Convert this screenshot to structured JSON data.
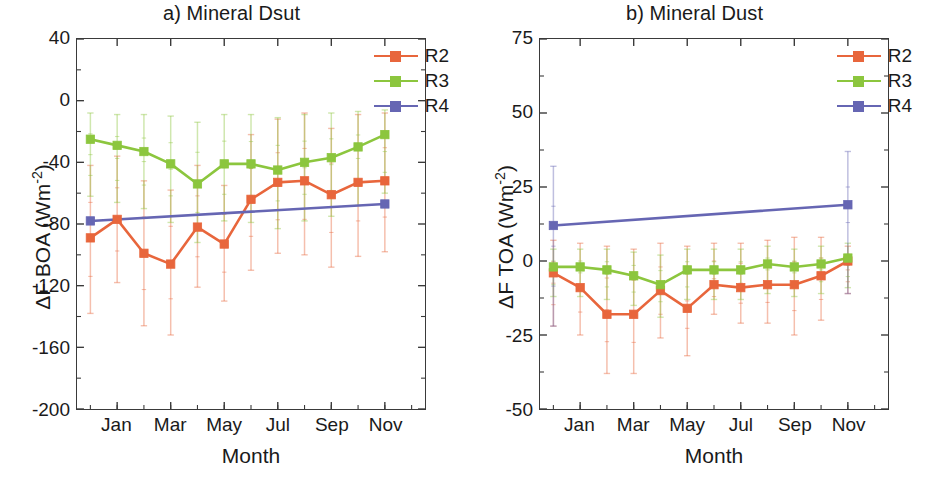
{
  "figure": {
    "axis_title_x": "Month",
    "tick_labels_x": [
      "Jan",
      "Mar",
      "May",
      "Jul",
      "Sep",
      "Nov"
    ],
    "colors": {
      "R2": "#E8663C",
      "R3": "#8CC63E",
      "R4": "#6666B3",
      "axis": "#3a3a3a",
      "text": "#1a1a1a",
      "background": "#ffffff"
    },
    "legend_entries": [
      "R2",
      "R3",
      "R4"
    ]
  },
  "panel_a": {
    "title": "a) Mineral Dsut",
    "axis_title_y_main": "ΔF BOA (Wm",
    "axis_title_y_sup": "-2",
    "axis_title_y_close": ")",
    "tick_labels_y": [
      "40",
      "0",
      "-40",
      "-80",
      "-120",
      "-160",
      "-200"
    ]
  },
  "panel_b": {
    "title": "b)  Mineral Dust",
    "axis_title_y_main": "ΔF TOA (Wm",
    "axis_title_y_sup": "-2",
    "axis_title_y_close": ")",
    "tick_labels_y": [
      "75",
      "50",
      "25",
      "0",
      "-25",
      "-50"
    ]
  },
  "chart_data": [
    {
      "type": "line",
      "panel": "a",
      "title": "a) Mineral Dsut",
      "xlabel": "Month",
      "ylabel": "ΔF BOA (Wm-2)",
      "ylim": [
        -200,
        40
      ],
      "yticks": [
        40,
        0,
        -40,
        -80,
        -120,
        -160,
        -200
      ],
      "xlim": [
        0,
        13
      ],
      "x": [
        0.5,
        1.5,
        2.5,
        3.5,
        4.5,
        5.5,
        6.5,
        7.5,
        8.5,
        9.5,
        10.5,
        11.5,
        12.5
      ],
      "xticks": [
        1.5,
        3.5,
        5.5,
        7.5,
        9.5,
        11.5
      ],
      "xticklabels": [
        "Jan",
        "Mar",
        "May",
        "Jul",
        "Sep",
        "Nov"
      ],
      "grid": false,
      "legend_position": "upper right",
      "series": [
        {
          "name": "R2",
          "color": "#E8663C",
          "marker": "square",
          "values": [
            -89,
            -77,
            -99,
            -106,
            -82,
            -93,
            -64,
            -53,
            -52,
            -61,
            -53,
            -52,
            null
          ],
          "err_low": [
            -138,
            -118,
            -146,
            -152,
            -121,
            -130,
            -110,
            -99,
            -100,
            -108,
            -101,
            -98,
            null
          ],
          "err_high": [
            -42,
            -36,
            -52,
            -58,
            -42,
            -55,
            -22,
            -12,
            -8,
            -18,
            -9,
            -8,
            null
          ]
        },
        {
          "name": "R3",
          "color": "#8CC63E",
          "marker": "square",
          "values": [
            -25,
            -29,
            -33,
            -41,
            -54,
            -41,
            -41,
            -45,
            -40,
            -37,
            -30,
            -22,
            null
          ],
          "err_low": [
            -62,
            -66,
            -70,
            -79,
            -92,
            -78,
            -79,
            -83,
            -78,
            -75,
            -68,
            -60,
            null
          ],
          "err_high": [
            -8,
            -9,
            -9,
            -10,
            -14,
            -9,
            -9,
            -11,
            -9,
            -8,
            -7,
            -6,
            null
          ]
        },
        {
          "name": "R4",
          "color": "#6666B3",
          "marker": "square",
          "values": [
            -78,
            null,
            null,
            null,
            null,
            null,
            null,
            null,
            null,
            null,
            null,
            -67,
            null
          ],
          "err_low": [
            -78,
            null,
            null,
            null,
            null,
            null,
            null,
            null,
            null,
            null,
            null,
            -67,
            null
          ],
          "err_high": [
            -78,
            null,
            null,
            null,
            null,
            null,
            null,
            null,
            null,
            null,
            null,
            -67,
            null
          ]
        }
      ]
    },
    {
      "type": "line",
      "panel": "b",
      "title": "b)  Mineral Dust",
      "xlabel": "Month",
      "ylabel": "ΔF TOA (Wm-2)",
      "ylim": [
        -50,
        75
      ],
      "yticks": [
        75,
        50,
        25,
        0,
        -25,
        -50
      ],
      "xlim": [
        0,
        13
      ],
      "x": [
        0.5,
        1.5,
        2.5,
        3.5,
        4.5,
        5.5,
        6.5,
        7.5,
        8.5,
        9.5,
        10.5,
        11.5,
        12.5
      ],
      "xticks": [
        1.5,
        3.5,
        5.5,
        7.5,
        9.5,
        11.5
      ],
      "xticklabels": [
        "Jan",
        "Mar",
        "May",
        "Jul",
        "Sep",
        "Nov"
      ],
      "grid": false,
      "legend_position": "upper right",
      "series": [
        {
          "name": "R2",
          "color": "#E8663C",
          "marker": "square",
          "values": [
            -4,
            -9,
            -18,
            -18,
            -10,
            -16,
            -8,
            -9,
            -8,
            -8,
            -5,
            0,
            null
          ],
          "err_low": [
            -22,
            -25,
            -38,
            -38,
            -26,
            -32,
            -18,
            -21,
            -21,
            -25,
            -20,
            -11,
            null
          ],
          "err_high": [
            7,
            6,
            5,
            4,
            6,
            5,
            6,
            6,
            7,
            8,
            8,
            5,
            null
          ]
        },
        {
          "name": "R3",
          "color": "#8CC63E",
          "marker": "square",
          "values": [
            -2,
            -2,
            -3,
            -5,
            -8,
            -3,
            -3,
            -3,
            -1,
            -2,
            -1,
            1,
            null
          ],
          "err_low": [
            -12,
            -12,
            -13,
            -15,
            -19,
            -13,
            -13,
            -13,
            -11,
            -12,
            -11,
            -9,
            null
          ],
          "err_high": [
            4,
            4,
            4,
            3,
            2,
            4,
            4,
            4,
            5,
            4,
            5,
            6,
            null
          ]
        },
        {
          "name": "R4",
          "color": "#6666B3",
          "marker": "square",
          "values": [
            12,
            null,
            null,
            null,
            null,
            null,
            null,
            null,
            null,
            null,
            null,
            19,
            null
          ],
          "err_low": [
            -22,
            null,
            null,
            null,
            null,
            null,
            null,
            null,
            null,
            null,
            null,
            -11,
            null
          ],
          "err_high": [
            32,
            null,
            null,
            null,
            null,
            null,
            null,
            null,
            null,
            null,
            null,
            37,
            null
          ]
        }
      ]
    }
  ]
}
